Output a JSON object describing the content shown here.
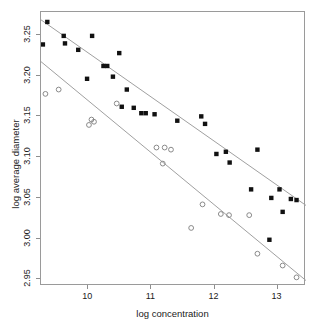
{
  "chart_data": {
    "type": "scatter",
    "title": "",
    "xlabel": "log concentration",
    "ylabel": "log average diameter",
    "xlim": [
      9.25,
      13.45
    ],
    "ylim": [
      2.942,
      3.278
    ],
    "xticks": [
      10,
      11,
      12,
      13
    ],
    "xtick_labels": [
      "10",
      "11",
      "12",
      "13"
    ],
    "yticks": [
      2.95,
      3.0,
      3.05,
      3.1,
      3.15,
      3.2,
      3.25
    ],
    "ytick_labels": [
      "2.95",
      "3.00",
      "3.05",
      "3.10",
      "3.15",
      "3.20",
      "3.25"
    ],
    "grid": false,
    "legend": "none",
    "series": [
      {
        "name": "filled",
        "marker": "filled-square",
        "color": "#111111",
        "points": [
          [
            9.35,
            3.2658
          ],
          [
            9.28,
            3.2382
          ],
          [
            9.61,
            3.2487
          ],
          [
            9.63,
            3.2395
          ],
          [
            9.84,
            3.2316
          ],
          [
            10.06,
            3.2487
          ],
          [
            10.49,
            3.2276
          ],
          [
            9.98,
            3.1961
          ],
          [
            10.24,
            3.2118
          ],
          [
            10.3,
            3.2118
          ],
          [
            10.39,
            3.1987
          ],
          [
            10.61,
            3.1829
          ],
          [
            10.53,
            3.1618
          ],
          [
            10.72,
            3.1605
          ],
          [
            10.91,
            3.1539
          ],
          [
            10.84,
            3.1539
          ],
          [
            11.05,
            3.1526
          ],
          [
            11.41,
            3.1447
          ],
          [
            11.79,
            3.15
          ],
          [
            11.85,
            3.1408
          ],
          [
            12.03,
            3.1039
          ],
          [
            12.18,
            3.1066
          ],
          [
            12.24,
            3.0934
          ],
          [
            12.68,
            3.1092
          ],
          [
            12.58,
            3.0605
          ],
          [
            12.9,
            3.05
          ],
          [
            13.03,
            3.0605
          ],
          [
            13.21,
            3.0487
          ],
          [
            13.3,
            3.0474
          ],
          [
            13.08,
            3.0329
          ],
          [
            12.87,
            2.9987
          ]
        ]
      },
      {
        "name": "open",
        "marker": "open-circle",
        "color": "#8a8a8a",
        "points": [
          [
            9.32,
            3.1776
          ],
          [
            9.53,
            3.1829
          ],
          [
            10.01,
            3.1395
          ],
          [
            10.09,
            3.1434
          ],
          [
            10.05,
            3.1461
          ],
          [
            10.45,
            3.1658
          ],
          [
            11.08,
            3.1118
          ],
          [
            11.21,
            3.1118
          ],
          [
            11.31,
            3.1092
          ],
          [
            11.18,
            3.0921
          ],
          [
            11.63,
            3.0132
          ],
          [
            11.81,
            3.0421
          ],
          [
            12.1,
            3.0303
          ],
          [
            12.23,
            3.0289
          ],
          [
            12.55,
            3.0289
          ],
          [
            12.68,
            2.9816
          ],
          [
            13.08,
            2.9671
          ],
          [
            13.3,
            2.9526
          ]
        ]
      }
    ],
    "fit_lines": [
      {
        "name": "filled-fit",
        "color": "#a0a0a0",
        "x0": 9.25,
        "y0": 3.2684,
        "x1": 13.45,
        "y1": 3.0408
      },
      {
        "name": "open-fit",
        "color": "#a0a0a0",
        "x0": 9.25,
        "y0": 3.2171,
        "x1": 13.45,
        "y1": 2.9487
      }
    ]
  }
}
